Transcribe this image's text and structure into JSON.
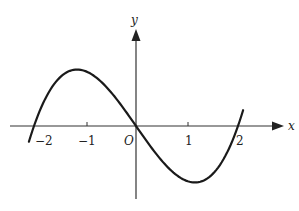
{
  "figure": {
    "axis_labels": {
      "x": "x",
      "y": "y",
      "origin": "O"
    },
    "x_ticks": [
      {
        "value": -2,
        "label": "−2"
      },
      {
        "value": -1,
        "label": "−1"
      },
      {
        "value": 1,
        "label": "1"
      },
      {
        "value": 2,
        "label": "2"
      }
    ],
    "colors": {
      "curve": "#1a1a1a",
      "axes": "#333333",
      "background": "#ffffff"
    }
  },
  "chart_data": {
    "type": "line",
    "title": "",
    "xlabel": "x",
    "ylabel": "y",
    "function": "y = k(x^3 - 4x), k > 0",
    "roots": [
      -2,
      0,
      2
    ],
    "local_max": {
      "x": -1
    },
    "local_min": {
      "x": 1
    },
    "x_tick_labels": [
      "−2",
      "−1",
      "O",
      "1",
      "2"
    ],
    "xlim": [
      -2.5,
      2.9
    ],
    "grid": false,
    "legend": null,
    "series": [
      {
        "name": "f(x)",
        "x": [
          -2.1,
          -2,
          -1.5,
          -1,
          -0.5,
          0,
          0.5,
          1,
          1.5,
          2,
          2.1
        ],
        "values": [
          -0.861,
          0,
          2.625,
          3,
          1.875,
          0,
          -1.875,
          -3,
          -2.625,
          0,
          0.861
        ]
      }
    ]
  }
}
